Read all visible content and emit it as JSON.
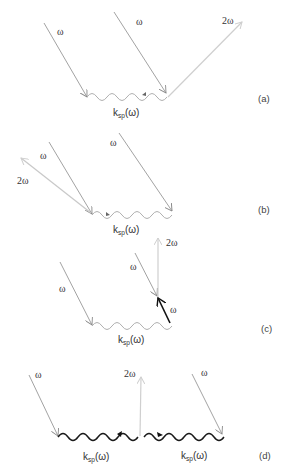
{
  "labels": {
    "omega": "ω",
    "two_omega": "2ω",
    "k": "k",
    "sp": "sp",
    "arg": "(ω)"
  },
  "panels": [
    {
      "id": "a",
      "label": "(a)"
    },
    {
      "id": "b",
      "label": "(b)"
    },
    {
      "id": "c",
      "label": "(c)"
    },
    {
      "id": "d",
      "label": "(d)"
    }
  ],
  "colors": {
    "incident": "#8a8a8a",
    "second_harmonic": "#c8c8c8",
    "plasmon_light": "#b0b0b0",
    "plasmon_dark": "#1a1a1a",
    "strong_arrow": "#111111"
  }
}
